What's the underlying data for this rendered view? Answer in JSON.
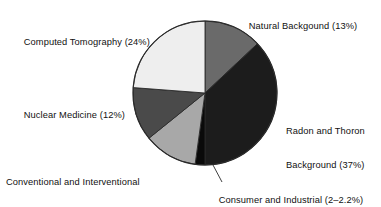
{
  "chart_data": {
    "type": "pie",
    "title": "",
    "subtitle": "",
    "xlabel": "",
    "ylabel": "",
    "legend_position": "callout-labels",
    "grid": false,
    "total_percent": 100,
    "start_angle_deg": 0,
    "direction": "clockwise",
    "center": {
      "x": 205,
      "y": 93
    },
    "radius": 72,
    "categories": [
      "Natural Backgound",
      "Radon and Thoron Background",
      "Consumer and Industrial",
      "Conventional and Interventional Radiography and Fluoroscopy",
      "Nuclear Medicine",
      "Computed Tomography"
    ],
    "values": [
      13,
      37,
      2.2,
      12,
      12,
      24
    ],
    "slices": [
      {
        "name": "Natural Backgound",
        "label": "Natural Backgound (13%)",
        "value": 13,
        "value_text": "13%",
        "color": "#6a6a6a",
        "start_deg": 0,
        "end_deg": 46.8
      },
      {
        "name": "Radon and Thoron Background",
        "label": "Radon and Thoron Background (37%)",
        "label_line1": "Radon and Thoron",
        "label_line2": "Background (37%)",
        "value": 37,
        "value_text": "37%",
        "color": "#1c1c1c",
        "start_deg": 46.8,
        "end_deg": 180.0
      },
      {
        "name": "Consumer and Industrial",
        "label": "Consumer and Industrial (2–2.2%)",
        "value": 2.2,
        "value_text": "2–2.2%",
        "color": "#0a0a0a",
        "start_deg": 180.0,
        "end_deg": 187.9
      },
      {
        "name": "Conventional and Interventional Radiography and Fluoroscopy",
        "label": "Conventional and Interventional Radiography and Fluoroscopy (12%)",
        "label_line1": "Conventional and Interventional",
        "label_line2": "Radiography and Fluoroscopy (12%)",
        "value": 12,
        "value_text": "12%",
        "color": "#a8a8a8",
        "start_deg": 187.9,
        "end_deg": 231.1
      },
      {
        "name": "Nuclear Medicine",
        "label": "Nuclear Medicine (12%)",
        "value": 12,
        "value_text": "12%",
        "color": "#4a4a4a",
        "start_deg": 231.1,
        "end_deg": 274.3
      },
      {
        "name": "Computed Tomography",
        "label": "Computed Tomography (24%)",
        "value": 24,
        "value_text": "24%",
        "color": "#eeeeee",
        "start_deg": 274.3,
        "end_deg": 360.0
      }
    ],
    "outline_color": "#2a2a2a",
    "background": "#ffffff"
  },
  "labels": {
    "natural_background": "Natural Backgound (13%)",
    "radon_thoron_line1": "Radon and Thoron",
    "radon_thoron_line2": "Background (37%)",
    "consumer_industrial": "Consumer and Industrial (2–2.2%)",
    "computed_tomography": "Computed Tomography (24%)",
    "nuclear_medicine": "Nuclear Medicine (12%)",
    "conventional_line1": "Conventional and Interventional",
    "conventional_line2": "Radiography and Fluoroscopy (12%)"
  }
}
